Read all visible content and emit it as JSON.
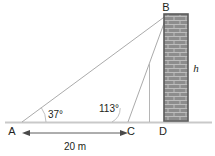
{
  "figure": {
    "type": "geometry-diagram",
    "background_color": "#ffffff",
    "line_color": "#9a9a9a",
    "text_color": "#231f20",
    "brick_fill": "#8a8a8a",
    "brick_mortar": "#b9b9b9",
    "brick_border": "#4a4a4a",
    "ground_color": "#c8c8c8"
  },
  "points": {
    "A": {
      "label": "A",
      "x": 16,
      "y": 130
    },
    "B": {
      "label": "B",
      "x": 166,
      "y": 8
    },
    "C": {
      "label": "C",
      "x": 128,
      "y": 130
    },
    "D": {
      "label": "D",
      "x": 163,
      "y": 130
    }
  },
  "angles": [
    {
      "name": "angle-at-A",
      "label": "37°",
      "value": 37,
      "vertex": "A",
      "x": 48,
      "y": 118
    },
    {
      "name": "angle-at-C",
      "label": "113°",
      "value": 113,
      "vertex": "C",
      "x": 99,
      "y": 112
    }
  ],
  "dimensions": [
    {
      "name": "base-AC",
      "label": "20 m",
      "value": 20,
      "unit": "m",
      "from": "A",
      "to": "C",
      "x": 75,
      "y": 148
    }
  ],
  "variables": [
    {
      "name": "wall-height",
      "label": "h",
      "x": 196,
      "y": 69
    }
  ],
  "segments": [
    {
      "name": "segment-AB",
      "from": "A",
      "to": "B"
    },
    {
      "name": "segment-CB",
      "from": "C",
      "to": "B"
    },
    {
      "name": "segment-AD-ground",
      "from": "A",
      "to": "D"
    },
    {
      "name": "segment-pole",
      "from": "E",
      "to": "B"
    }
  ]
}
